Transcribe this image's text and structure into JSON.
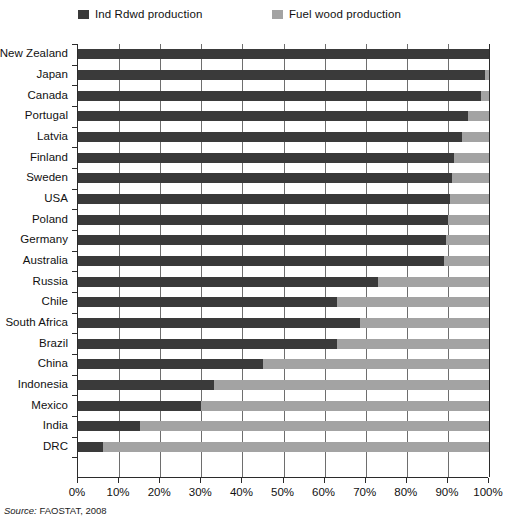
{
  "legend": {
    "position": "top",
    "entries": [
      {
        "label": "Ind Rdwd production",
        "color": "#3a3a3a"
      },
      {
        "label": "Fuel wood production",
        "color": "#a3a3a3"
      }
    ]
  },
  "axis": {
    "x_ticks": [
      "0%",
      "10%",
      "20%",
      "30%",
      "40%",
      "50%",
      "60%",
      "70%",
      "80%",
      "90%",
      "100%"
    ]
  },
  "source": {
    "prefix": "Source:",
    "text": "FAOSTAT, 2008"
  },
  "chart_data": {
    "type": "bar",
    "orientation": "horizontal",
    "stacked": true,
    "normalized": true,
    "title": "",
    "subtitle": "",
    "xlabel": "",
    "ylabel": "",
    "xlim": [
      0,
      100
    ],
    "xtick_labels": [
      "0%",
      "10%",
      "20%",
      "30%",
      "40%",
      "50%",
      "60%",
      "70%",
      "80%",
      "90%",
      "100%"
    ],
    "xtick_values": [
      0,
      10,
      20,
      30,
      40,
      50,
      60,
      70,
      80,
      90,
      100
    ],
    "grid": "vertical",
    "legend_position": "top",
    "categories": [
      "New Zealand",
      "Japan",
      "Canada",
      "Portugal",
      "Latvia",
      "Finland",
      "Sweden",
      "USA",
      "Poland",
      "Germany",
      "Australia",
      "Russia",
      "Chile",
      "South Africa",
      "Brazil",
      "China",
      "Indonesia",
      "Mexico",
      "India",
      "DRC"
    ],
    "series": [
      {
        "name": "Ind Rdwd production",
        "color": "#3a3a3a",
        "values": [
          100,
          99,
          98,
          95,
          93.5,
          91.5,
          91,
          90.5,
          90,
          89.5,
          89,
          73,
          63,
          68.5,
          63,
          45,
          33,
          30,
          15,
          6
        ]
      },
      {
        "name": "Fuel wood production",
        "color": "#a3a3a3",
        "values": [
          0,
          1,
          2,
          5,
          6.5,
          8.5,
          9,
          9.5,
          10,
          10.5,
          11,
          27,
          37,
          31.5,
          37,
          55,
          67,
          70,
          85,
          94
        ]
      }
    ]
  }
}
